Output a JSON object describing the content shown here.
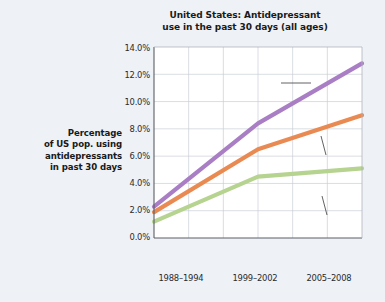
{
  "chart_data": {
    "type": "line",
    "title": "United States: Antidepressant use in the past 30 days (all ages)",
    "title_line1": "United States: Antidepressant",
    "title_line2": "use in the past 30 days (all ages)",
    "ylabel": "Percentage of US pop. using antidepressants in past 30 days",
    "ylabel_line1": "Percentage",
    "ylabel_line2": "of US pop. using",
    "ylabel_line3": "antidepressants",
    "ylabel_line4": "in past 30 days",
    "xlabel": "",
    "categories": [
      "1988–1994",
      "1999–2002",
      "2005–2008"
    ],
    "ylim": [
      0.0,
      14.0
    ],
    "yticks": [
      "0.0%",
      "2.0%",
      "4.0%",
      "6.0%",
      "8.0%",
      "10.0%",
      "12.0%",
      "14.0%"
    ],
    "ytick_values": [
      0.0,
      2.0,
      4.0,
      6.0,
      8.0,
      10.0,
      12.0,
      14.0
    ],
    "grid": true,
    "legend_position": "inline-annotations",
    "series": [
      {
        "name": "Female",
        "color": "#a97ec4",
        "values": [
          2.3,
          8.4,
          12.8
        ]
      },
      {
        "name": "Total",
        "color": "#e98a52",
        "values": [
          1.9,
          6.5,
          9.0
        ]
      },
      {
        "name": "Male",
        "color": "#b6d390",
        "values": [
          1.2,
          4.5,
          5.1
        ]
      }
    ],
    "annotations": [
      {
        "text": "Female",
        "series": "Female"
      },
      {
        "text": "Total",
        "series": "Total"
      },
      {
        "text": "Male",
        "series": "Male"
      }
    ]
  },
  "colors": {
    "background": "#eef1f6",
    "plot_background": "#ffffff",
    "axis": "#5a5f66",
    "grid": "#c9ced6",
    "text": "#1a1a1a"
  }
}
